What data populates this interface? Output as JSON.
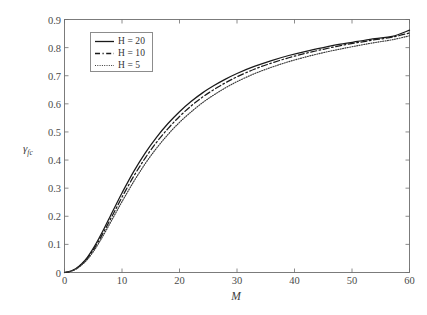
{
  "chart_data": {
    "type": "line",
    "title": "",
    "xlabel": "M",
    "ylabel": "γ",
    "ylabel_sub": "fc",
    "xlim": [
      0,
      60
    ],
    "ylim": [
      0,
      0.9
    ],
    "grid": false,
    "legend_position": "upper-left",
    "xticks": [
      0,
      10,
      20,
      30,
      40,
      50,
      60
    ],
    "xtick_labels": [
      "0",
      "10",
      "20",
      "30",
      "40",
      "50",
      "60"
    ],
    "yticks": [
      0,
      0.1,
      0.2,
      0.3,
      0.4,
      0.5,
      0.6,
      0.7,
      0.8,
      0.9
    ],
    "ytick_labels": [
      "0",
      "0.1",
      "0.2",
      "0.3",
      "0.4",
      "0.5",
      "0.6",
      "0.7",
      "0.8",
      "0.9"
    ],
    "x": [
      0,
      1,
      2,
      3,
      4,
      5,
      6,
      7,
      8,
      9,
      10,
      12,
      14,
      16,
      18,
      20,
      22,
      24,
      26,
      28,
      30,
      33,
      36,
      39,
      42,
      45,
      48,
      51,
      54,
      57,
      60
    ],
    "series": [
      {
        "name": "H = 20",
        "label": "H = 20",
        "style": "solid",
        "color": "#1a1a1a",
        "values": [
          0.0,
          0.004,
          0.014,
          0.031,
          0.055,
          0.086,
          0.122,
          0.161,
          0.202,
          0.243,
          0.283,
          0.358,
          0.424,
          0.481,
          0.53,
          0.572,
          0.608,
          0.639,
          0.665,
          0.688,
          0.708,
          0.733,
          0.754,
          0.772,
          0.787,
          0.8,
          0.812,
          0.822,
          0.832,
          0.84,
          0.862
        ]
      },
      {
        "name": "H = 10",
        "label": "H = 10",
        "style": "dashed",
        "color": "#1a1a1a",
        "values": [
          0.0,
          0.004,
          0.013,
          0.029,
          0.051,
          0.08,
          0.114,
          0.151,
          0.19,
          0.229,
          0.268,
          0.341,
          0.406,
          0.463,
          0.512,
          0.555,
          0.592,
          0.624,
          0.651,
          0.675,
          0.696,
          0.723,
          0.745,
          0.764,
          0.78,
          0.794,
          0.807,
          0.818,
          0.828,
          0.837,
          0.852
        ]
      },
      {
        "name": "H = 5",
        "label": "H = 5",
        "style": "dotted",
        "color": "#3a3a3a",
        "values": [
          0.0,
          0.004,
          0.012,
          0.027,
          0.047,
          0.074,
          0.106,
          0.141,
          0.178,
          0.215,
          0.252,
          0.322,
          0.386,
          0.442,
          0.491,
          0.534,
          0.571,
          0.604,
          0.632,
          0.657,
          0.679,
          0.707,
          0.73,
          0.75,
          0.767,
          0.782,
          0.795,
          0.807,
          0.818,
          0.828,
          0.842
        ]
      }
    ]
  },
  "legend": {
    "entries": [
      {
        "label": "H = 20"
      },
      {
        "label": "H = 10"
      },
      {
        "label": "H = 5"
      }
    ]
  },
  "axes": {
    "frame_color": "#6e6e6e",
    "x_label": "M",
    "y_label": "γ",
    "y_label_sub": "fc"
  }
}
